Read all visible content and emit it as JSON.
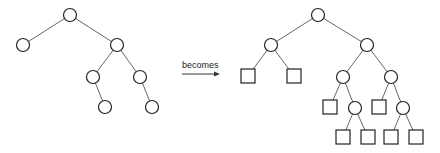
{
  "diagram": {
    "arrow_label": "becomes",
    "colors": {
      "stroke": "#222222",
      "edge": "#555555",
      "background": "#ffffff"
    },
    "before_tree": {
      "nodes": [
        {
          "id": "a",
          "type": "internal",
          "x": 70,
          "y": 15
        },
        {
          "id": "b",
          "type": "internal",
          "x": 23,
          "y": 45
        },
        {
          "id": "c",
          "type": "internal",
          "x": 117,
          "y": 45
        },
        {
          "id": "d",
          "type": "internal",
          "x": 93,
          "y": 77
        },
        {
          "id": "e",
          "type": "internal",
          "x": 140,
          "y": 77
        },
        {
          "id": "f",
          "type": "internal",
          "x": 105,
          "y": 107
        },
        {
          "id": "g",
          "type": "internal",
          "x": 152,
          "y": 107
        }
      ],
      "edges": [
        [
          "a",
          "b"
        ],
        [
          "a",
          "c"
        ],
        [
          "c",
          "d"
        ],
        [
          "c",
          "e"
        ],
        [
          "d",
          "f"
        ],
        [
          "e",
          "g"
        ]
      ]
    },
    "after_tree": {
      "nodes": [
        {
          "id": "A",
          "type": "internal",
          "x": 318,
          "y": 15
        },
        {
          "id": "B",
          "type": "internal",
          "x": 271,
          "y": 45
        },
        {
          "id": "C",
          "type": "internal",
          "x": 367,
          "y": 45
        },
        {
          "id": "B1",
          "type": "leaf",
          "x": 248,
          "y": 76
        },
        {
          "id": "B2",
          "type": "leaf",
          "x": 294,
          "y": 76
        },
        {
          "id": "D",
          "type": "internal",
          "x": 343,
          "y": 77
        },
        {
          "id": "E",
          "type": "internal",
          "x": 391,
          "y": 77
        },
        {
          "id": "D1",
          "type": "leaf",
          "x": 330,
          "y": 107
        },
        {
          "id": "F",
          "type": "internal",
          "x": 355,
          "y": 108
        },
        {
          "id": "E1",
          "type": "leaf",
          "x": 379,
          "y": 107
        },
        {
          "id": "G",
          "type": "internal",
          "x": 403,
          "y": 108
        },
        {
          "id": "F1",
          "type": "leaf",
          "x": 343,
          "y": 137
        },
        {
          "id": "F2",
          "type": "leaf",
          "x": 368,
          "y": 137
        },
        {
          "id": "G1",
          "type": "leaf",
          "x": 391,
          "y": 137
        },
        {
          "id": "G2",
          "type": "leaf",
          "x": 416,
          "y": 137
        }
      ],
      "edges": [
        [
          "A",
          "B"
        ],
        [
          "A",
          "C"
        ],
        [
          "B",
          "B1"
        ],
        [
          "B",
          "B2"
        ],
        [
          "C",
          "D"
        ],
        [
          "C",
          "E"
        ],
        [
          "D",
          "D1"
        ],
        [
          "D",
          "F"
        ],
        [
          "E",
          "E1"
        ],
        [
          "E",
          "G"
        ],
        [
          "F",
          "F1"
        ],
        [
          "F",
          "F2"
        ],
        [
          "G",
          "G1"
        ],
        [
          "G",
          "G2"
        ]
      ]
    }
  }
}
